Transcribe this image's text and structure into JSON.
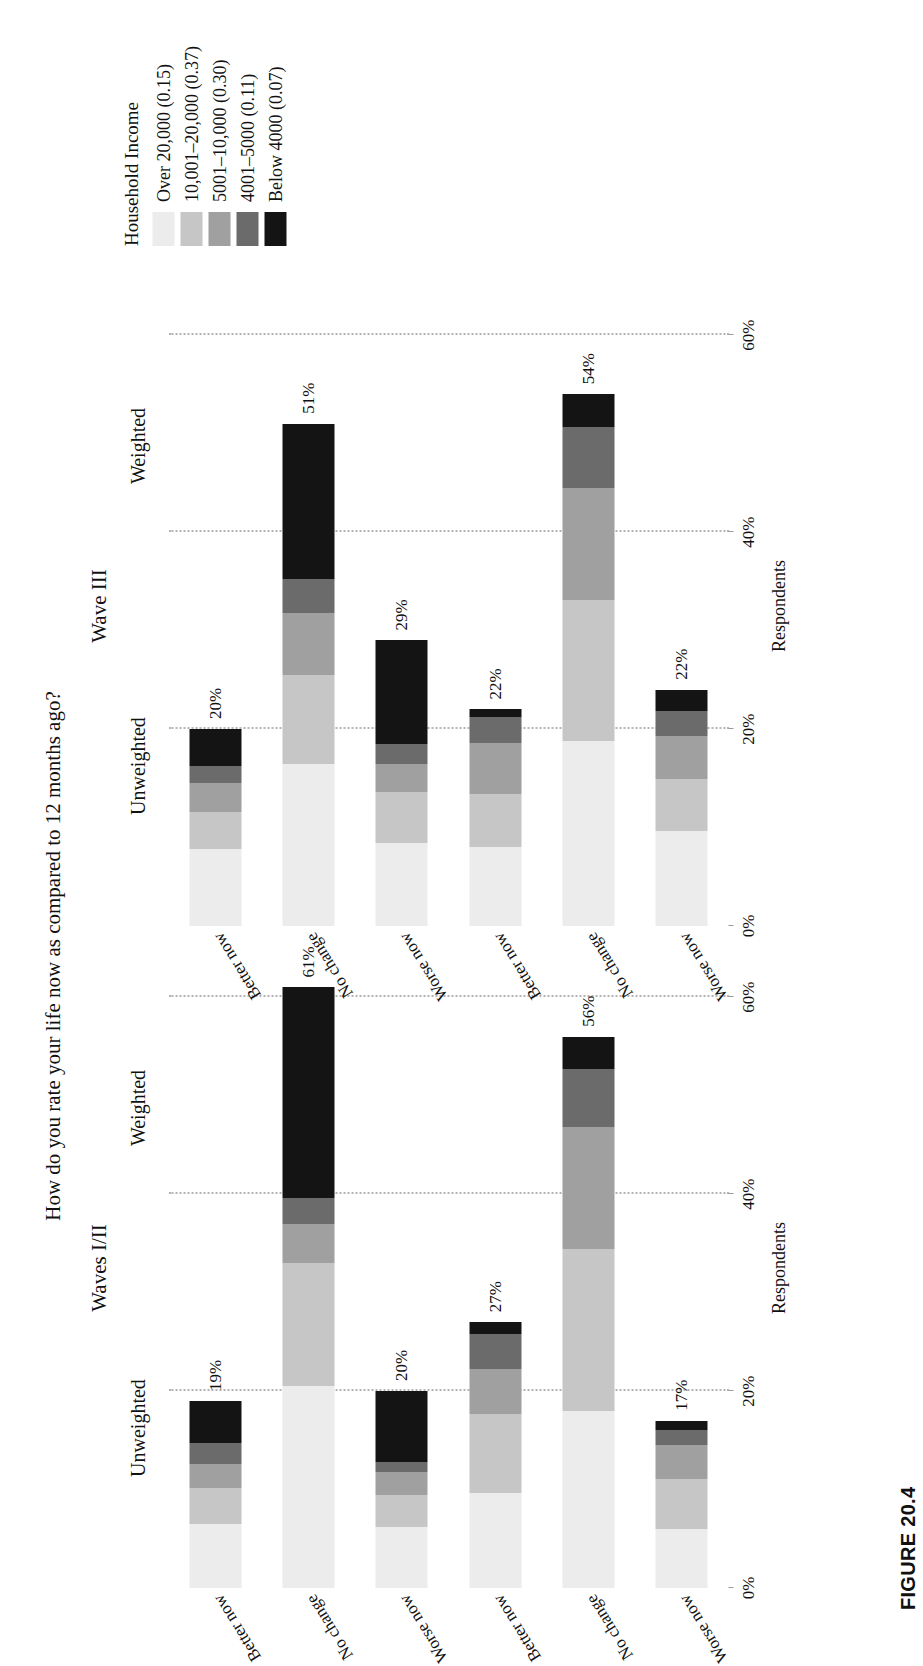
{
  "figure": {
    "caption": "FIGURE 20.4",
    "title": "How do you rate your life now as compared to 12 months ago?"
  },
  "axis": {
    "y_axis_name": "Respondents",
    "tick_labels": [
      "0%",
      "20%",
      "40%",
      "60%"
    ],
    "tick_values": [
      0,
      20,
      40,
      60
    ],
    "ylim": [
      0,
      65
    ]
  },
  "legend": {
    "title": "Household Income",
    "entries": [
      {
        "label": "Over 20,000 (0.15)",
        "color": "#ececec",
        "weight": 0.15
      },
      {
        "label": "10,001–20,000 (0.37)",
        "color": "#c6c6c6",
        "weight": 0.37
      },
      {
        "label": "5001–10,000 (0.30)",
        "color": "#a0a0a0",
        "weight": 0.3
      },
      {
        "label": "4001–5000 (0.11)",
        "color": "#6b6b6b",
        "weight": 0.11
      },
      {
        "label": "Below 4000 (0.07)",
        "color": "#141414",
        "weight": 0.07
      }
    ]
  },
  "panels": [
    {
      "name": "Waves I/II",
      "groups": [
        {
          "name": "Unweighted",
          "categories": [
            "Better now",
            "No change",
            "Worse now"
          ],
          "totals": [
            19,
            61,
            20
          ],
          "total_labels": [
            "19%",
            "61%",
            "20%"
          ],
          "stacks": [
            [
              6.5,
              3.7,
              2.4,
              2.1,
              4.3
            ],
            [
              20.5,
              12.5,
              4.0,
              2.6,
              21.4
            ],
            [
              6.2,
              3.2,
              2.4,
              1.0,
              7.2
            ]
          ]
        },
        {
          "name": "Weighted",
          "categories": [
            "Better now",
            "No change",
            "Worse now"
          ],
          "totals": [
            27,
            56,
            17
          ],
          "total_labels": [
            "27%",
            "56%",
            "17%"
          ],
          "stacks": [
            [
              9.6,
              8.1,
              4.5,
              3.6,
              1.2
            ],
            [
              18.0,
              16.4,
              12.4,
              5.9,
              3.3
            ],
            [
              6.0,
              5.1,
              3.4,
              1.6,
              0.9
            ]
          ]
        }
      ]
    },
    {
      "name": "Wave III",
      "groups": [
        {
          "name": "Unweighted",
          "categories": [
            "Better now",
            "No change",
            "Worse now"
          ],
          "totals": [
            20,
            51,
            29
          ],
          "total_labels": [
            "20%",
            "51%",
            "29%"
          ],
          "stacks": [
            [
              7.8,
              3.8,
              2.9,
              1.8,
              3.7
            ],
            [
              16.5,
              9.0,
              6.3,
              3.4,
              15.8
            ],
            [
              8.4,
              5.2,
              2.9,
              2.0,
              10.5
            ]
          ]
        },
        {
          "name": "Weighted",
          "categories": [
            "Better now",
            "No change",
            "Worse now"
          ],
          "totals": [
            22,
            54,
            24
          ],
          "total_labels": [
            "22%",
            "54%",
            "22%"
          ],
          "stacks": [
            [
              8.0,
              5.4,
              5.2,
              2.6,
              0.8
            ],
            [
              18.8,
              14.3,
              11.4,
              6.2,
              3.3
            ],
            [
              9.6,
              5.3,
              4.4,
              2.5,
              2.2
            ]
          ]
        }
      ]
    }
  ],
  "chart_data": {
    "type": "bar",
    "title": "How do you rate your life now as compared to 12 months ago?",
    "subtype": "stacked-horizontal-grouped",
    "xlabel": "",
    "ylabel": "Respondents",
    "ylim": [
      0,
      65
    ],
    "yticks": [
      0,
      20,
      40,
      60
    ],
    "ytick_labels": [
      "0%",
      "20%",
      "40%",
      "60%"
    ],
    "grid": "dotted-vertical-at-yticks",
    "legend_position": "top-right",
    "legend_title": "Household Income",
    "series": [
      {
        "name": "Over 20,000 (0.15)",
        "color": "#ececec"
      },
      {
        "name": "10,001–20,000 (0.37)",
        "color": "#c6c6c6"
      },
      {
        "name": "5001–10,000 (0.30)",
        "color": "#a0a0a0"
      },
      {
        "name": "4001–5000 (0.11)",
        "color": "#6b6b6b"
      },
      {
        "name": "Below 4000 (0.07)",
        "color": "#141414"
      }
    ],
    "panels": [
      "Waves I/II",
      "Wave III"
    ],
    "groups": [
      "Unweighted",
      "Weighted"
    ],
    "categories": [
      "Better now",
      "No change",
      "Worse now"
    ],
    "totals": {
      "Waves I/II": {
        "Unweighted": [
          19,
          61,
          20
        ],
        "Weighted": [
          27,
          56,
          17
        ]
      },
      "Wave III": {
        "Unweighted": [
          20,
          51,
          29
        ],
        "Weighted": [
          22,
          54,
          24
        ]
      }
    },
    "stacked_values": {
      "Waves I/II": {
        "Unweighted": [
          [
            6.5,
            3.7,
            2.4,
            2.1,
            4.3
          ],
          [
            20.5,
            12.5,
            4.0,
            2.6,
            21.4
          ],
          [
            6.2,
            3.2,
            2.4,
            1.0,
            7.2
          ]
        ],
        "Weighted": [
          [
            9.6,
            8.1,
            4.5,
            3.6,
            1.2
          ],
          [
            18.0,
            16.4,
            12.4,
            5.9,
            3.3
          ],
          [
            6.0,
            5.1,
            3.4,
            1.6,
            0.9
          ]
        ]
      },
      "Wave III": {
        "Unweighted": [
          [
            7.8,
            3.8,
            2.9,
            1.8,
            3.7
          ],
          [
            16.5,
            9.0,
            6.3,
            3.4,
            15.8
          ],
          [
            8.4,
            5.2,
            2.9,
            2.0,
            10.5
          ]
        ],
        "Weighted": [
          [
            8.0,
            5.4,
            5.2,
            2.6,
            0.8
          ],
          [
            18.8,
            14.3,
            11.4,
            6.2,
            3.3
          ],
          [
            9.6,
            5.3,
            4.4,
            2.5,
            2.2
          ]
        ]
      }
    }
  }
}
